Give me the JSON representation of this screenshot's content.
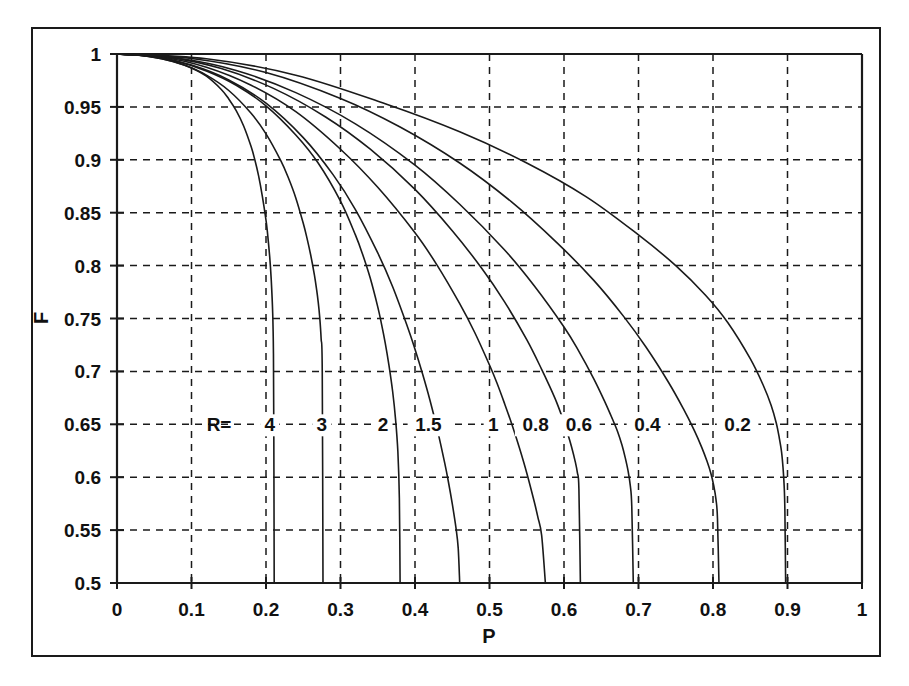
{
  "figure": {
    "kind": "line-chart",
    "background_color": "#ffffff",
    "line_color": "#1a1a1a",
    "grid_color": "#1a1a1a",
    "has_outer_frame": true
  },
  "chart_data": {
    "type": "line",
    "title": "",
    "subtitle": "",
    "xlabel": "P",
    "ylabel": "F",
    "xlim": [
      0,
      1
    ],
    "ylim": [
      0.5,
      1
    ],
    "grid": true,
    "grid_style": "dashed",
    "legend": "inline-curve-labels",
    "legend_prefix": "R=",
    "legend_row_y": 0.65,
    "x_ticks": [
      "0",
      "0.1",
      "0.2",
      "0.3",
      "0.4",
      "0.5",
      "0.6",
      "0.7",
      "0.8",
      "0.9",
      "1"
    ],
    "x_tick_values": [
      0,
      0.1,
      0.2,
      0.3,
      0.4,
      0.5,
      0.6,
      0.7,
      0.8,
      0.9,
      1
    ],
    "y_ticks": [
      "0.5",
      "0.55",
      "0.6",
      "0.65",
      "0.7",
      "0.75",
      "0.8",
      "0.85",
      "0.9",
      "0.95",
      "1"
    ],
    "y_tick_values": [
      0.5,
      0.55,
      0.6,
      0.65,
      0.7,
      0.75,
      0.8,
      0.85,
      0.9,
      0.95,
      1
    ],
    "series": [
      {
        "name": "4",
        "R": 4,
        "label": "4",
        "label_x": 0.205,
        "label_y": 0.65,
        "x": [
          0,
          0.02,
          0.04,
          0.06,
          0.08,
          0.1,
          0.12,
          0.14,
          0.15,
          0.16,
          0.17,
          0.18,
          0.185,
          0.19,
          0.195,
          0.2,
          0.202,
          0.205,
          0.207,
          0.209,
          0.21,
          0.2105,
          0.211
        ],
        "y": [
          1,
          0.9995,
          0.998,
          0.9955,
          0.992,
          0.9868,
          0.979,
          0.9665,
          0.9575,
          0.9465,
          0.932,
          0.9125,
          0.9,
          0.885,
          0.866,
          0.843,
          0.831,
          0.808,
          0.787,
          0.755,
          0.717,
          0.64,
          0.5
        ]
      },
      {
        "name": "3",
        "R": 3,
        "label": "3",
        "label_x": 0.275,
        "label_y": 0.65,
        "x": [
          0,
          0.03,
          0.06,
          0.09,
          0.12,
          0.15,
          0.18,
          0.2,
          0.22,
          0.23,
          0.24,
          0.25,
          0.255,
          0.26,
          0.265,
          0.268,
          0.27,
          0.272,
          0.274,
          0.2755,
          0.2765
        ],
        "y": [
          1,
          0.9988,
          0.9955,
          0.9895,
          0.98,
          0.9655,
          0.944,
          0.9245,
          0.899,
          0.883,
          0.864,
          0.84,
          0.826,
          0.81,
          0.791,
          0.777,
          0.766,
          0.752,
          0.731,
          0.7,
          0.5
        ]
      },
      {
        "name": "2",
        "R": 2,
        "label": "2",
        "label_x": 0.357,
        "label_y": 0.65,
        "x": [
          0,
          0.04,
          0.08,
          0.12,
          0.16,
          0.2,
          0.24,
          0.27,
          0.3,
          0.32,
          0.33,
          0.34,
          0.35,
          0.355,
          0.36,
          0.365,
          0.37,
          0.374,
          0.377,
          0.379,
          0.38
        ],
        "y": [
          1,
          0.9982,
          0.9932,
          0.984,
          0.9705,
          0.951,
          0.9235,
          0.897,
          0.861,
          0.829,
          0.81,
          0.788,
          0.761,
          0.745,
          0.727,
          0.706,
          0.681,
          0.654,
          0.624,
          0.58,
          0.5
        ]
      },
      {
        "name": "1.5",
        "R": 1.5,
        "label": "1.5",
        "label_x": 0.418,
        "label_y": 0.65,
        "x": [
          0,
          0.05,
          0.1,
          0.15,
          0.2,
          0.25,
          0.29,
          0.32,
          0.35,
          0.37,
          0.39,
          0.4,
          0.41,
          0.42,
          0.43,
          0.44,
          0.445,
          0.45,
          0.455,
          0.458,
          0.46
        ],
        "y": [
          1,
          0.9975,
          0.9895,
          0.9755,
          0.9535,
          0.921,
          0.886,
          0.853,
          0.812,
          0.78,
          0.742,
          0.721,
          0.698,
          0.673,
          0.645,
          0.613,
          0.595,
          0.575,
          0.552,
          0.533,
          0.5
        ]
      },
      {
        "name": "1",
        "R": 1,
        "label": "1",
        "label_x": 0.505,
        "label_y": 0.65,
        "x": [
          0,
          0.06,
          0.12,
          0.18,
          0.24,
          0.3,
          0.35,
          0.4,
          0.43,
          0.46,
          0.48,
          0.5,
          0.51,
          0.52,
          0.53,
          0.54,
          0.55,
          0.56,
          0.565,
          0.57,
          0.575
        ],
        "y": [
          1,
          0.9972,
          0.9875,
          0.9705,
          0.9455,
          0.91,
          0.874,
          0.831,
          0.8,
          0.764,
          0.737,
          0.706,
          0.689,
          0.67,
          0.65,
          0.628,
          0.604,
          0.577,
          0.562,
          0.545,
          0.5
        ]
      },
      {
        "name": "0.8",
        "R": 0.8,
        "label": "0.8",
        "label_x": 0.562,
        "label_y": 0.65,
        "x": [
          0,
          0.07,
          0.14,
          0.21,
          0.28,
          0.34,
          0.4,
          0.45,
          0.49,
          0.52,
          0.55,
          0.57,
          0.58,
          0.59,
          0.6,
          0.605,
          0.61,
          0.615,
          0.618,
          0.62,
          0.622
        ],
        "y": [
          1,
          0.9968,
          0.9862,
          0.9675,
          0.9405,
          0.91,
          0.872,
          0.833,
          0.797,
          0.766,
          0.73,
          0.702,
          0.687,
          0.671,
          0.652,
          0.641,
          0.629,
          0.615,
          0.604,
          0.589,
          0.5
        ]
      },
      {
        "name": "0.6",
        "R": 0.6,
        "label": "0.6",
        "label_x": 0.62,
        "label_y": 0.65,
        "x": [
          0,
          0.08,
          0.16,
          0.24,
          0.32,
          0.4,
          0.46,
          0.52,
          0.56,
          0.6,
          0.62,
          0.64,
          0.655,
          0.665,
          0.672,
          0.678,
          0.682,
          0.686,
          0.689,
          0.691,
          0.693
        ],
        "y": [
          1,
          0.9962,
          0.9845,
          0.9635,
          0.934,
          0.895,
          0.858,
          0.815,
          0.781,
          0.742,
          0.719,
          0.693,
          0.671,
          0.655,
          0.643,
          0.63,
          0.619,
          0.606,
          0.592,
          0.572,
          0.5
        ]
      },
      {
        "name": "0.4",
        "R": 0.4,
        "label": "0.4",
        "label_x": 0.712,
        "label_y": 0.65,
        "x": [
          0,
          0.1,
          0.2,
          0.3,
          0.38,
          0.46,
          0.53,
          0.59,
          0.64,
          0.68,
          0.71,
          0.74,
          0.76,
          0.775,
          0.785,
          0.792,
          0.797,
          0.801,
          0.804,
          0.806,
          0.808
        ],
        "y": [
          1,
          0.9958,
          0.9825,
          0.958,
          0.931,
          0.897,
          0.86,
          0.822,
          0.786,
          0.752,
          0.723,
          0.69,
          0.665,
          0.644,
          0.628,
          0.615,
          0.604,
          0.592,
          0.579,
          0.561,
          0.5
        ]
      },
      {
        "name": "0.2",
        "R": 0.2,
        "label": "0.2",
        "label_x": 0.833,
        "label_y": 0.65,
        "x": [
          0,
          0.12,
          0.24,
          0.36,
          0.46,
          0.55,
          0.63,
          0.7,
          0.75,
          0.79,
          0.82,
          0.85,
          0.868,
          0.878,
          0.885,
          0.889,
          0.892,
          0.894,
          0.8955,
          0.8965,
          0.8975
        ],
        "y": [
          1,
          0.9955,
          0.98,
          0.953,
          0.9265,
          0.897,
          0.865,
          0.829,
          0.8,
          0.772,
          0.746,
          0.712,
          0.686,
          0.668,
          0.651,
          0.637,
          0.624,
          0.609,
          0.592,
          0.568,
          0.5
        ]
      }
    ]
  }
}
